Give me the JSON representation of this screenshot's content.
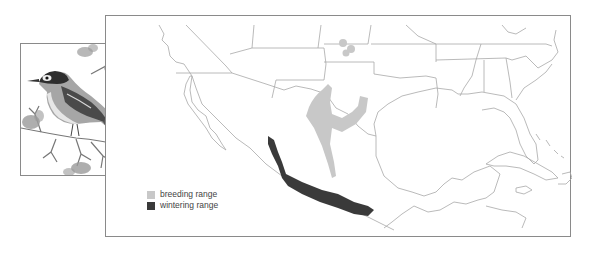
{
  "figure": {
    "type": "species range map",
    "region": "Southern United States, Mexico, Central America and Caribbean"
  },
  "illustration": {
    "subject": "songbird perched on flowering branch",
    "style": "grayscale pencil drawing"
  },
  "legend": {
    "items": [
      {
        "label": "breeding range",
        "color": "#c8c8c8"
      },
      {
        "label": "wintering range",
        "color": "#3a3a3a"
      }
    ]
  },
  "colors": {
    "frame_border": "#8a8a8a",
    "borders": "#a8a8a8",
    "breeding": "#c8c8c8",
    "wintering": "#3a3a3a"
  }
}
